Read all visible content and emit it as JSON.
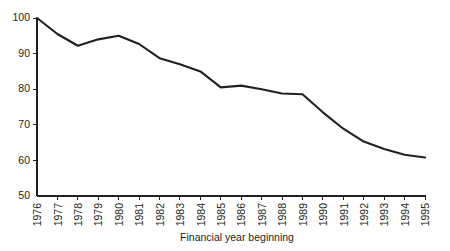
{
  "chart_data": {
    "type": "line",
    "title": "",
    "xlabel": "Financial year beginning",
    "ylabel": "",
    "grid": false,
    "legend": null,
    "xlim": [
      1976,
      1995
    ],
    "ylim": [
      50,
      100
    ],
    "y_ticks": [
      50,
      60,
      70,
      80,
      90,
      100
    ],
    "y_tick_labels": [
      "50",
      "60",
      "70",
      "80",
      "90",
      "100"
    ],
    "categories": [
      "1976",
      "1977",
      "1978",
      "1979",
      "1980",
      "1981",
      "1982",
      "1983",
      "1984",
      "1985",
      "1986",
      "1987",
      "1988",
      "1989",
      "1990",
      "1991",
      "1992",
      "1993",
      "1994",
      "1995"
    ],
    "x": [
      1976,
      1977,
      1978,
      1979,
      1980,
      1981,
      1982,
      1983,
      1984,
      1985,
      1986,
      1987,
      1988,
      1989,
      1990,
      1991,
      1992,
      1993,
      1994,
      1995
    ],
    "values": [
      100.0,
      95.5,
      92.2,
      94.0,
      95.0,
      92.7,
      88.7,
      87.0,
      85.0,
      80.5,
      81.0,
      80.0,
      78.8,
      78.6,
      73.5,
      68.9,
      65.3,
      63.2,
      61.6,
      60.8
    ],
    "series": [
      {
        "name": "index",
        "color": "#231f20",
        "values": [
          100.0,
          95.5,
          92.2,
          94.0,
          95.0,
          92.7,
          88.7,
          87.0,
          85.0,
          80.5,
          81.0,
          80.0,
          78.8,
          78.6,
          73.5,
          68.9,
          65.3,
          63.2,
          61.6,
          60.8
        ]
      }
    ]
  },
  "colors": {
    "line": "#231f20",
    "axis": "#231f20",
    "background": "#ffffff",
    "text": "#231f20"
  }
}
